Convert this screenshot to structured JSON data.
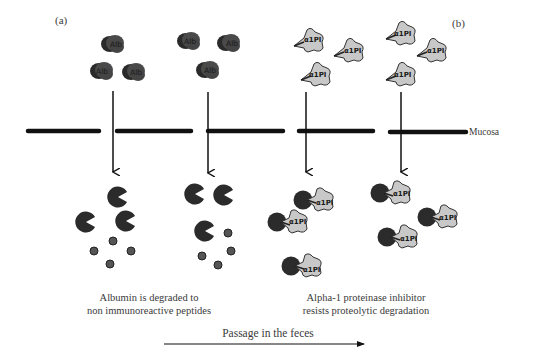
{
  "figure": {
    "panel_a_label": "(a)",
    "panel_b_label": "(b)",
    "membrane_label": "Mucosa",
    "caption_a": {
      "line1": "Albumin is degraded to",
      "line2": "non immunoreactive peptides"
    },
    "caption_b": {
      "line1": "Alpha-1 proteinase inhibitor",
      "line2": "resists proteolytic degradation"
    },
    "flow_label": "Passage in the feces",
    "molecule_labels": {
      "albumin": "Alb",
      "a1pi": "α1PI"
    },
    "colors": {
      "albumin": "#4a4a4a",
      "albumin_dark": "#2a2a2a",
      "protease": "#2b2b2b",
      "a1pi_fill": "#c8c8c8",
      "a1pi_stroke": "#333333",
      "peptide": "#555555",
      "membrane": "#111111",
      "text": "#3a3a3a"
    }
  }
}
